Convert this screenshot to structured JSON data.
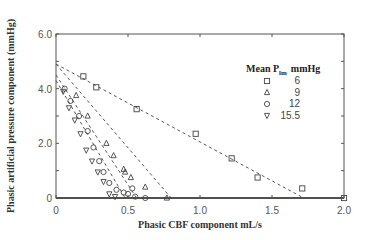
{
  "chart_data": {
    "type": "scatter",
    "title": "",
    "xlabel": "Phasic CBF component mL/s",
    "ylabel": "Phasic artificial pressure component (mmHg)",
    "xlim": [
      0,
      2.0
    ],
    "ylim": [
      0,
      6.0
    ],
    "xticks": [
      0,
      0.5,
      1.0,
      1.5,
      2.0
    ],
    "xtick_labels": [
      "0",
      "0.5",
      "1.0",
      "1.5",
      "2.0"
    ],
    "yticks": [
      0,
      2.0,
      4.0,
      6.0
    ],
    "ytick_labels": [
      "0",
      "2.0",
      "4.0",
      "6.0"
    ],
    "grid": false,
    "legend": {
      "title_main": "Mean P",
      "title_sub": "lm",
      "title_unit": "mmHg",
      "position": "upper right"
    },
    "series": [
      {
        "name": "6",
        "marker": "square",
        "fit_line": {
          "x0": 0,
          "y0": 4.9,
          "x1": 1.72,
          "y1": 0
        },
        "points": [
          [
            0.19,
            4.45
          ],
          [
            0.28,
            4.05
          ],
          [
            0.56,
            3.25
          ],
          [
            0.97,
            2.35
          ],
          [
            1.22,
            1.45
          ],
          [
            1.4,
            0.75
          ],
          [
            1.71,
            0.35
          ],
          [
            2.0,
            0.0
          ]
        ]
      },
      {
        "name": "9",
        "marker": "triangle-up",
        "fit_line": {
          "x0": 0,
          "y0": 4.9,
          "x1": 0.8,
          "y1": 0
        },
        "points": [
          [
            0.14,
            3.75
          ],
          [
            0.22,
            3.0
          ],
          [
            0.35,
            2.0
          ],
          [
            0.4,
            1.55
          ],
          [
            0.47,
            1.05
          ],
          [
            0.48,
            0.95
          ],
          [
            0.52,
            0.75
          ],
          [
            0.62,
            0.4
          ],
          [
            0.77,
            0.0
          ]
        ]
      },
      {
        "name": "12",
        "marker": "circle",
        "fit_line": {
          "x0": 0,
          "y0": 4.5,
          "x1": 0.56,
          "y1": 0
        },
        "points": [
          [
            0.06,
            4.0
          ],
          [
            0.1,
            3.55
          ],
          [
            0.16,
            3.0
          ],
          [
            0.22,
            2.45
          ],
          [
            0.26,
            1.85
          ],
          [
            0.3,
            1.35
          ],
          [
            0.33,
            0.95
          ],
          [
            0.37,
            0.55
          ],
          [
            0.42,
            0.3
          ],
          [
            0.47,
            0.2
          ],
          [
            0.5,
            0.15
          ],
          [
            0.53,
            0.35
          ],
          [
            0.55,
            0.05
          ],
          [
            0.62,
            0.0
          ]
        ]
      },
      {
        "name": "15.5",
        "marker": "triangle-down",
        "fit_line": {
          "x0": 0,
          "y0": 4.3,
          "x1": 0.48,
          "y1": 0
        },
        "points": [
          [
            0.05,
            3.9
          ],
          [
            0.09,
            3.3
          ],
          [
            0.13,
            2.85
          ],
          [
            0.17,
            2.35
          ],
          [
            0.21,
            1.75
          ],
          [
            0.25,
            1.35
          ],
          [
            0.29,
            0.95
          ],
          [
            0.33,
            0.6
          ],
          [
            0.37,
            0.15
          ],
          [
            0.41,
            0.05
          ]
        ]
      }
    ]
  }
}
